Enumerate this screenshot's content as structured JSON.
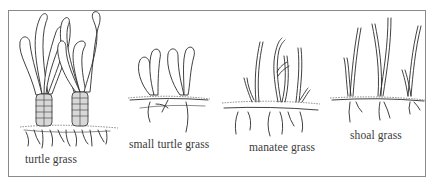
{
  "figure": {
    "border_color": "#8a8a8a",
    "ink_color": "#2b2b2b",
    "label_color": "#3a3a3a"
  },
  "species": [
    {
      "id": "turtle-grass",
      "label": "turtle grass",
      "description": "broad strap-like blades with rounded tips, thick scaly sheaths, dense rhizome roots"
    },
    {
      "id": "small-turtle-grass",
      "label": "small turtle grass",
      "description": "short oval paddle-shaped leaf pairs on horizontal rhizome with long roots"
    },
    {
      "id": "manatee-grass",
      "label": "manatee grass",
      "description": "cylindrical thin branching blades above sediment, branching rhizome and roots"
    },
    {
      "id": "shoal-grass",
      "label": "shoal grass",
      "description": "tall narrow flat blades on long horizontal rhizome with sparse roots"
    }
  ]
}
